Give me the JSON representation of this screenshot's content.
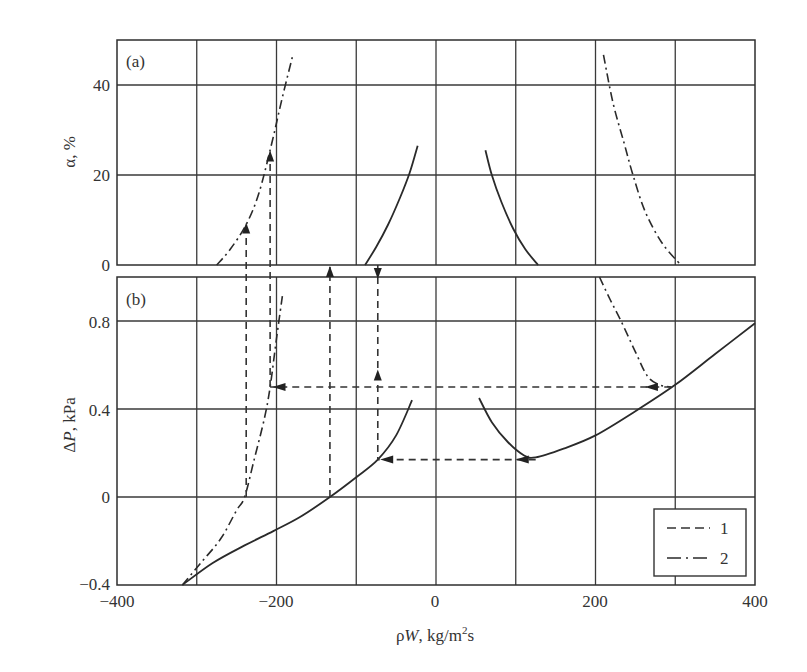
{
  "chart_data": [
    {
      "panel": "(a)",
      "type": "line",
      "xlabel": "ρW, kg/m²s",
      "ylabel": "α, %",
      "xlim": [
        -400,
        400
      ],
      "ylim": [
        0,
        50
      ],
      "xticks": [
        -400,
        -200,
        0,
        200,
        400
      ],
      "yticks": [
        0,
        20,
        40
      ],
      "grid": true,
      "series": [
        {
          "name": "2",
          "style": "dash-dot",
          "points": [
            [
              -275,
              0
            ],
            [
              -258,
              3.5
            ],
            [
              -238,
              9
            ],
            [
              -222,
              16
            ],
            [
              -206,
              27
            ],
            [
              -193,
              37
            ],
            [
              -179,
              47
            ]
          ]
        },
        {
          "name": "solid-left",
          "style": "solid",
          "points": [
            [
              -89,
              0
            ],
            [
              -75,
              4
            ],
            [
              -60,
              9
            ],
            [
              -45,
              15
            ],
            [
              -33,
              20.5
            ],
            [
              -23,
              26.5
            ]
          ]
        },
        {
          "name": "solid-right",
          "style": "solid",
          "points": [
            [
              62,
              25.5
            ],
            [
              70,
              20
            ],
            [
              82,
              14
            ],
            [
              97,
              8
            ],
            [
              112,
              3.5
            ],
            [
              128,
              0
            ]
          ]
        },
        {
          "name": "2",
          "style": "dash-dot",
          "points": [
            [
              210,
              46.7
            ],
            [
              222,
              36
            ],
            [
              236,
              27
            ],
            [
              247,
              20
            ],
            [
              262,
              12
            ],
            [
              283,
              5
            ],
            [
              307,
              0
            ]
          ]
        }
      ],
      "arrows": [
        {
          "x": -238,
          "from": 0,
          "to": 9,
          "direction": "up"
        },
        {
          "x": -208,
          "from": 0,
          "to": 25,
          "direction": "up"
        }
      ]
    },
    {
      "panel": "(b)",
      "type": "line",
      "xlabel": "ρW, kg/m²s",
      "ylabel": "ΔP, kPa",
      "xlim": [
        -400,
        400
      ],
      "ylim": [
        -0.4,
        1.0
      ],
      "xticks": [
        -400,
        -200,
        0,
        200,
        400
      ],
      "yticks": [
        -0.4,
        0,
        0.4,
        0.8
      ],
      "grid": true,
      "legend": {
        "position": "lower right",
        "entries": [
          {
            "label": "1",
            "style": "dashed"
          },
          {
            "label": "2",
            "style": "dash-dot"
          }
        ]
      },
      "series": [
        {
          "name": "solid-left",
          "style": "solid",
          "points": [
            [
              -318,
              -0.4
            ],
            [
              -280,
              -0.3
            ],
            [
              -240,
              -0.22
            ],
            [
              -204,
              -0.155
            ],
            [
              -170,
              -0.09
            ],
            [
              -133,
              0
            ],
            [
              -100,
              0.09
            ],
            [
              -73,
              0.17
            ],
            [
              -50,
              0.28
            ],
            [
              -30,
              0.44
            ]
          ]
        },
        {
          "name": "solid-right",
          "style": "solid",
          "points": [
            [
              54,
              0.45
            ],
            [
              70,
              0.34
            ],
            [
              90,
              0.25
            ],
            [
              110,
              0.19
            ],
            [
              125,
              0.18
            ],
            [
              160,
              0.22
            ],
            [
              200,
              0.28
            ],
            [
              250,
              0.39
            ],
            [
              300,
              0.51
            ],
            [
              350,
              0.65
            ],
            [
              400,
              0.79
            ]
          ]
        },
        {
          "name": "2",
          "style": "dash-dot",
          "points": [
            [
              -318,
              -0.4
            ],
            [
              -295,
              -0.3
            ],
            [
              -270,
              -0.19
            ],
            [
              -250,
              -0.06
            ],
            [
              -240,
              0
            ],
            [
              -228,
              0.17
            ],
            [
              -215,
              0.36
            ],
            [
              -208,
              0.5
            ],
            [
              -200,
              0.72
            ],
            [
              -192,
              0.93
            ]
          ]
        },
        {
          "name": "2",
          "style": "dash-dot",
          "points": [
            [
              205,
              1.0
            ],
            [
              218,
              0.9
            ],
            [
              232,
              0.8
            ],
            [
              250,
              0.66
            ],
            [
              265,
              0.55
            ],
            [
              280,
              0.51
            ],
            [
              295,
              0.5
            ]
          ]
        }
      ],
      "arrows": [
        {
          "x": -238,
          "from": 0,
          "to": 1.1,
          "direction": "up"
        },
        {
          "x": -208,
          "from": 0.5,
          "to": 1.1,
          "direction": "up"
        },
        {
          "x": -133,
          "from": 0,
          "to": 1.1,
          "direction": "up"
        },
        {
          "x": -73,
          "from": 1.1,
          "to": 0.17,
          "direction": "down-then-up",
          "up_arrow_at": 0.58
        },
        {
          "y": 0.5,
          "from": 295,
          "to": -208,
          "direction": "left"
        },
        {
          "y": 0.17,
          "from": 125,
          "to": -73,
          "direction": "left"
        }
      ]
    }
  ],
  "labels": {
    "panel_a": "(a)",
    "panel_b": "(b)",
    "ylabel_a": "α, %",
    "ylabel_b_prefix": "Δ",
    "ylabel_b_var": "P",
    "ylabel_b_suffix": ", kPa",
    "xlabel_prefix": "ρ",
    "xlabel_var": "W",
    "xlabel_units": ", kg/m",
    "xlabel_sup": "2",
    "xlabel_end": "s",
    "xticks": [
      "−400",
      "−200",
      "0",
      "200",
      "400"
    ],
    "yticks_a": [
      "40",
      "20",
      "0"
    ],
    "yticks_b": [
      "0.8",
      "0.4",
      "0",
      "−0.4"
    ],
    "legend_1": "1",
    "legend_2": "2"
  }
}
